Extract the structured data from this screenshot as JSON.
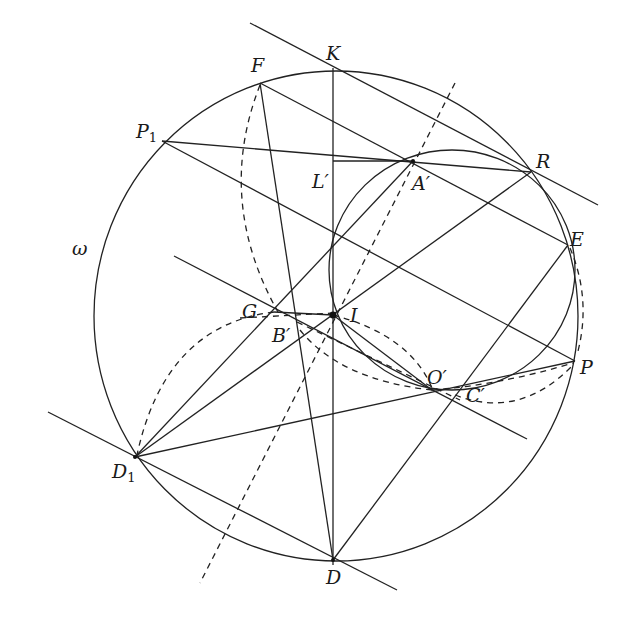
{
  "figure": {
    "type": "geometry-diagram",
    "circle_label": "ω",
    "points": {
      "K": {
        "label": "K",
        "x": 333,
        "y": 70
      },
      "F": {
        "label": "F",
        "x": 260,
        "y": 83
      },
      "P1": {
        "label": "P",
        "sub": "1",
        "x": 162,
        "y": 141
      },
      "R": {
        "label": "R",
        "x": 531,
        "y": 172
      },
      "A_prime": {
        "label": "A′",
        "x": 413,
        "y": 161
      },
      "L_prime": {
        "label": "L′",
        "x": 333,
        "y": 161
      },
      "E": {
        "label": "E",
        "x": 568,
        "y": 245
      },
      "G": {
        "label": "G",
        "x": 274,
        "y": 313
      },
      "B_prime": {
        "label": "B′",
        "x": 292,
        "y": 320
      },
      "I": {
        "label": "I",
        "x": 333,
        "y": 315
      },
      "O_prime": {
        "label": "O′",
        "x": 432,
        "y": 390
      },
      "C_prime": {
        "label": "C′",
        "x": 455,
        "y": 395
      },
      "P": {
        "label": "P",
        "x": 575,
        "y": 361
      },
      "D1": {
        "label": "D",
        "sub": "1",
        "x": 135,
        "y": 457
      },
      "D": {
        "label": "D",
        "x": 333,
        "y": 560
      }
    },
    "labels": {
      "K": "K",
      "F": "F",
      "P1_main": "P",
      "P1_sub": "1",
      "R": "R",
      "A_prime": "A′",
      "L_prime": "L′",
      "E": "E",
      "G": "G",
      "B_prime": "B′",
      "I": "I",
      "O_prime": "O′",
      "C_prime": "C′",
      "P": "P",
      "D1_main": "D",
      "D1_sub": "1",
      "D": "D",
      "omega": "ω"
    },
    "circles": [
      {
        "name": "omega",
        "cx": 333,
        "cy": 315,
        "r": 245,
        "style": "solid"
      },
      {
        "name": "circle-A'RPI",
        "cx": 452,
        "cy": 270,
        "r": 124,
        "style": "solid"
      }
    ]
  }
}
